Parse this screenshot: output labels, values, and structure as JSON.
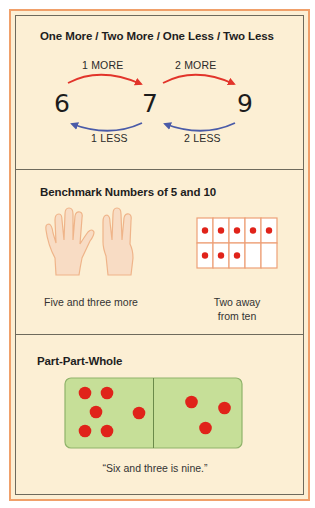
{
  "sections": [
    {
      "title": "One More / Two More / One Less / Two Less",
      "numbers": [
        "6",
        "7",
        "9"
      ],
      "arrows": {
        "more": [
          "1 MORE",
          "2 MORE"
        ],
        "less": [
          "1 LESS",
          "2 LESS"
        ]
      },
      "colors": {
        "more": "#e2342a",
        "less": "#4a5ba8"
      }
    },
    {
      "title": "Benchmark Numbers of 5 and 10",
      "hands_caption": "Five and three more",
      "hands": {
        "left_fingers_up": 5,
        "right_fingers_up": 3
      },
      "ten_frame": {
        "filled": 8,
        "total": 10
      },
      "ten_frame_caption_line1": "Two away",
      "ten_frame_caption_line2": "from ten"
    },
    {
      "title": "Part-Part-Whole",
      "domino": {
        "left_dots": 6,
        "right_dots": 3
      },
      "caption": "“Six and three is nine.”"
    }
  ],
  "colors": {
    "background": "#fcefd4",
    "outer_border": "#f0a06a",
    "inner_border": "#6e6a5c",
    "dot_red": "#e0231a",
    "domino_green": "#c6df98",
    "ten_frame_line": "#eda077",
    "hand_fill": "#f8dcc4",
    "hand_outline": "#efb489"
  }
}
